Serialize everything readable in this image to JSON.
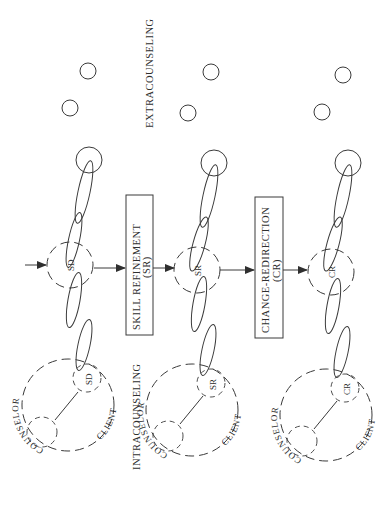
{
  "diagram": {
    "regions": {
      "extracounseling": "EXTRACOUNSELING",
      "intracounseling": "INTRACOUNSELING"
    },
    "phases": [
      {
        "id": "sd",
        "node_label": "SD",
        "inner_label": "SD",
        "counselor_label": "COUNSELOR",
        "client_label": "CLIENT"
      },
      {
        "id": "sr",
        "node_label": "SR",
        "inner_label": "SR",
        "counselor_label": "COUNSELOR",
        "client_label": "CLIENT"
      },
      {
        "id": "cr",
        "node_label": "CR",
        "inner_label": "CR",
        "counselor_label": "COUNSELOR",
        "client_label": "CLIENT"
      }
    ],
    "transitions": [
      {
        "label": "SKILL REFINEMENT",
        "abbrev": "(SR)"
      },
      {
        "label": "CHANGE-REDIRECTION",
        "abbrev": "(CR)"
      }
    ],
    "colors": {
      "ink": "#3a3a3a",
      "background": "#ffffff"
    }
  }
}
